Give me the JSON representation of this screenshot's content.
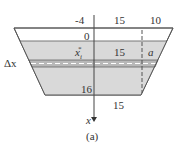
{
  "figure": {
    "caption": "(a)",
    "axis_label": "x",
    "labels": {
      "top_left_coord": "-4",
      "top_middle_width": "15",
      "top_right_width": "10",
      "water_level": "0",
      "sample_point": "x",
      "sample_point_sub": "i",
      "sample_point_sup": "*",
      "middle_width": "15",
      "side_var": "a",
      "delta_x": "Δx",
      "bottom_depth": "16",
      "bottom_width": "15"
    },
    "colors": {
      "fill": "#d9d9d9",
      "band": "#b8b8b8",
      "outline": "#555555"
    }
  }
}
